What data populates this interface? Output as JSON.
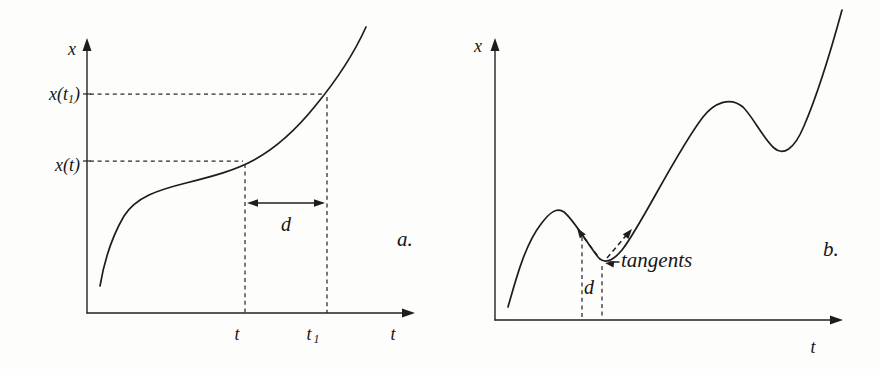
{
  "figure": {
    "background_color": "#fdfdfc",
    "ink_color": "#222222",
    "panel_a": {
      "caption": "a.",
      "y_axis_label": "x",
      "x_axis_label": "t",
      "y_label_upper": {
        "pre": "x(t",
        "sub": "1",
        "post": ")"
      },
      "y_label_lower": "x(t)",
      "x_tick_left": "t",
      "x_tick_right": {
        "base": "t",
        "sub": "1"
      },
      "interval_label": "d",
      "curve_path": "M 100 286 C 104 262 110 240 124 216 C 136 197 158 190 186 183 C 214 176 236 170 254 160 C 274 149 296 130 316 105 C 330 88 352 58 366 27"
    },
    "panel_b": {
      "caption": "b.",
      "y_axis_label": "x",
      "x_axis_label": "t",
      "tangents_label": "tangents",
      "interval_label": "d",
      "curve_path": "M 508 307 C 515 283 524 246 541 224 C 550 212 557 207 564 212 C 573 219 588 244 598 257 C 604 264 612 262 622 250 C 640 228 676 152 703 117 C 714 103 730 96 743 107 C 753 117 763 138 774 148 C 783 156 794 150 804 126 C 816 98 830 54 842 10"
    }
  }
}
